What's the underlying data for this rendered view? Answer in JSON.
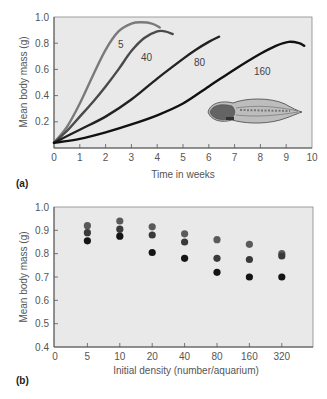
{
  "chart_data": [
    {
      "panel": "(a)",
      "type": "line",
      "title": "",
      "xlabel": "Time in weeks",
      "ylabel": "Mean body mass (g)",
      "xlim": [
        0,
        10
      ],
      "ylim": [
        0,
        1.0
      ],
      "x_ticks": [
        "0",
        "1",
        "2",
        "3",
        "4",
        "5",
        "6",
        "7",
        "8",
        "9",
        "10"
      ],
      "y_ticks": [
        "0.2",
        "0.4",
        "0.6",
        "0.8",
        "1.0"
      ],
      "grid": false,
      "legend": "inline curve labels",
      "annotation": "tadpole illustration",
      "series": [
        {
          "name": "5",
          "color": "#7a7a7a",
          "x": [
            0,
            0.5,
            1,
            1.5,
            2,
            2.5,
            3,
            3.4,
            3.8,
            4.1
          ],
          "y": [
            0.04,
            0.16,
            0.34,
            0.55,
            0.75,
            0.89,
            0.95,
            0.96,
            0.95,
            0.92
          ]
        },
        {
          "name": "40",
          "color": "#4a4a4a",
          "x": [
            0,
            0.5,
            1,
            1.5,
            2,
            2.5,
            3,
            3.5,
            4,
            4.3,
            4.6
          ],
          "y": [
            0.04,
            0.13,
            0.24,
            0.35,
            0.47,
            0.6,
            0.74,
            0.84,
            0.89,
            0.89,
            0.87
          ]
        },
        {
          "name": "80",
          "color": "#222222",
          "x": [
            0,
            1,
            2,
            3,
            4,
            5,
            5.5,
            6,
            6.4
          ],
          "y": [
            0.04,
            0.14,
            0.24,
            0.37,
            0.53,
            0.68,
            0.75,
            0.81,
            0.85
          ]
        },
        {
          "name": "160",
          "color": "#111111",
          "x": [
            0,
            1,
            2,
            3,
            4,
            5,
            6,
            7,
            8,
            8.6,
            9.1,
            9.5,
            9.7
          ],
          "y": [
            0.04,
            0.07,
            0.12,
            0.18,
            0.25,
            0.34,
            0.47,
            0.6,
            0.72,
            0.78,
            0.81,
            0.8,
            0.78
          ]
        }
      ]
    },
    {
      "panel": "(b)",
      "type": "scatter",
      "title": "",
      "xlabel": "Initial density (number/aquarium)",
      "ylabel": "Mean body mass (g)",
      "ylim": [
        0.4,
        1.0
      ],
      "categories": [
        "5",
        "10",
        "20",
        "40",
        "80",
        "160",
        "320"
      ],
      "x_ticks": [
        "0",
        "5",
        "10",
        "20",
        "40",
        "80",
        "160",
        "320"
      ],
      "y_ticks": [
        "0.4",
        "0.5",
        "0.6",
        "0.7",
        "0.8",
        "0.9",
        "1.0"
      ],
      "grid": false,
      "series": [
        {
          "name": "upper",
          "color": "#5a5a5a",
          "values": [
            0.92,
            0.94,
            0.915,
            0.885,
            0.86,
            0.84,
            0.8
          ]
        },
        {
          "name": "middle",
          "color": "#3a3a3a",
          "values": [
            0.89,
            0.905,
            0.88,
            0.85,
            0.78,
            0.775,
            0.79
          ]
        },
        {
          "name": "lower",
          "color": "#151515",
          "values": [
            0.855,
            0.875,
            0.805,
            0.78,
            0.72,
            0.7,
            0.7
          ]
        }
      ]
    }
  ],
  "labels": {
    "panel_a": "(a)",
    "panel_b": "(b)",
    "a_xlabel": "Time in weeks",
    "a_ylabel": "Mean body mass (g)",
    "b_xlabel": "Initial density (number/aquarium)",
    "b_ylabel": "Mean body mass (g)"
  },
  "colors": {
    "plot_background": "#e9e9e9",
    "frame": "#777777",
    "tick_text": "#555555"
  }
}
